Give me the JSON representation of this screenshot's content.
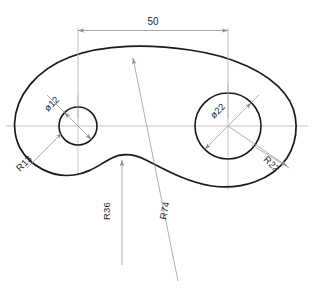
{
  "drawing": {
    "title": "Cam plate outline with two bores",
    "units": "mm",
    "background_color": "#ffffff",
    "outline_color": "#1a1a1a",
    "construction_color": "#b6b6b6",
    "dimension_color": "#8e8e8e",
    "text_color": "#2a2a2a"
  },
  "dimensions": {
    "width_50": {
      "label": "50",
      "type": "linear",
      "value": 50,
      "orientation": "horizontal"
    },
    "bore_small": {
      "label": "ø12",
      "type": "diameter",
      "value": 12
    },
    "bore_large": {
      "label": "ø22",
      "type": "diameter",
      "value": 22
    },
    "radius_left": {
      "label": "R13",
      "type": "radius",
      "value": 13
    },
    "radius_right": {
      "label": "R22",
      "type": "radius",
      "value": 22
    },
    "radius_bottom": {
      "label": "R36",
      "type": "radius",
      "value": 36
    },
    "radius_top": {
      "label": "R74",
      "type": "radius",
      "value": 74
    }
  },
  "features": {
    "small_hole": {
      "center_x": 78,
      "center_y": 126,
      "radius_px": 19
    },
    "large_hole": {
      "center_x": 228,
      "center_y": 126,
      "radius_px": 33
    }
  }
}
